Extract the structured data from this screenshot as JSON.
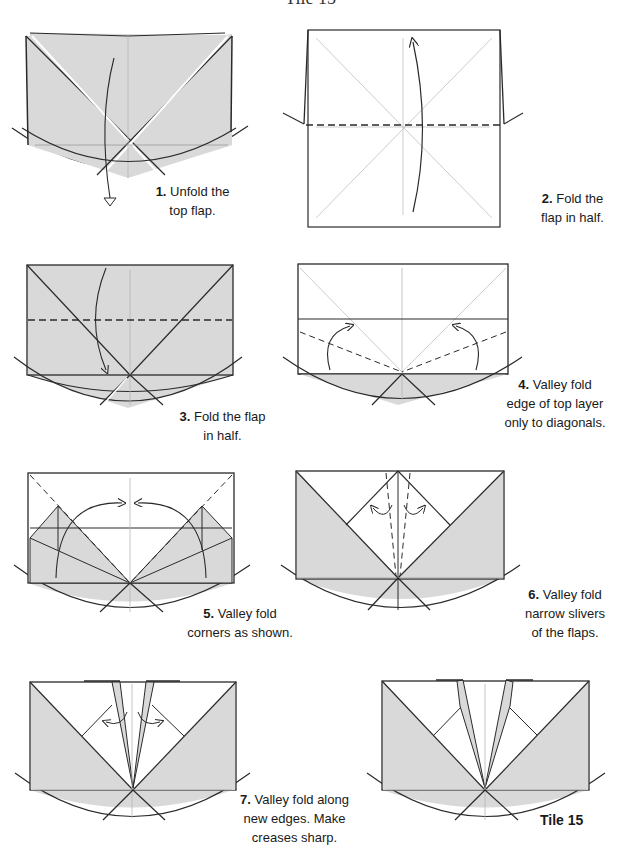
{
  "header": {
    "title": "Tile 15"
  },
  "colors": {
    "paper_shade": "#d9d9d9",
    "line": "#2a2a2a",
    "crease": "#b5b5b5",
    "background": "#ffffff"
  },
  "steps": [
    {
      "number": "1.",
      "text": "Unfold the",
      "text2": "top flap."
    },
    {
      "number": "2.",
      "text": "Fold the",
      "text2": "flap in half."
    },
    {
      "number": "3.",
      "text": "Fold the flap",
      "text2": "in half."
    },
    {
      "number": "4.",
      "text": "Valley fold",
      "text2": "edge of top layer",
      "text3": "only to diagonals."
    },
    {
      "number": "5.",
      "text": "Valley fold",
      "text2": "corners as shown."
    },
    {
      "number": "6.",
      "text": "Valley fold",
      "text2": "narrow slivers",
      "text3": "of the flaps."
    },
    {
      "number": "7.",
      "text": "Valley fold along",
      "text2": "new edges.  Make",
      "text3": "creases sharp."
    }
  ],
  "footer": {
    "tile_label": "Tile 15"
  }
}
